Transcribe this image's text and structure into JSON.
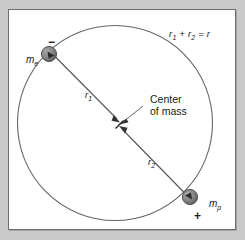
{
  "figure": {
    "type": "physics-diagram",
    "background_color": "#c9c9c9",
    "panel_color": "#ffffff",
    "line_color": "#555555",
    "text_color": "#1a1a1a",
    "sphere_color": "#808080"
  },
  "labels": {
    "equation": "r₁ + r₂ = r",
    "equation_parts": {
      "r1": "r",
      "r1_sub": "1",
      "plus": "+",
      "r2": "r",
      "r2_sub": "2",
      "equals": "=",
      "r": "r"
    },
    "mass_electron": "m",
    "mass_electron_sub": "e",
    "mass_proton": "m",
    "mass_proton_sub": "p",
    "charge_negative": "−",
    "charge_positive": "+",
    "radius_1": "r",
    "radius_1_sub": "1",
    "radius_2": "r",
    "radius_2_sub": "2",
    "center_of_mass_line1": "Center",
    "center_of_mass_line2": "of mass"
  },
  "geometry": {
    "orbit_circle": {
      "cx": 114.5,
      "cy": 122.5,
      "r": 97.5
    },
    "electron_body": {
      "cx": 48,
      "cy": 53,
      "r": 7.5
    },
    "proton_body": {
      "cx": 189,
      "cy": 196,
      "r": 7.5
    },
    "center_of_mass_point": {
      "x": 119,
      "y": 122
    },
    "axis_line": {
      "x1": 48,
      "y1": 53,
      "x2": 189,
      "y2": 196
    }
  }
}
